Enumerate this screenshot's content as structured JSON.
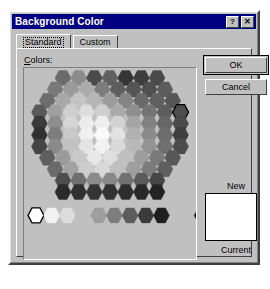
{
  "window": {
    "title": "Background Color",
    "help_button": "?",
    "close_button": "✕"
  },
  "tabs": [
    {
      "label": "Standard",
      "selected": true
    },
    {
      "label": "Custom",
      "selected": false
    }
  ],
  "colors_section": {
    "label_prefix": "C",
    "label_rest": "olors:"
  },
  "buttons": {
    "ok": "OK",
    "cancel": "Cancel"
  },
  "preview": {
    "new_label": "New",
    "current_label": "Current",
    "new_color": "#ffffff",
    "current_color": "#ffffff"
  },
  "palette": {
    "type": "grayscale-honeycomb",
    "selected_index": 33,
    "hex_width": 16,
    "hex_height": 15,
    "rows": [
      {
        "offset": 3,
        "colors": [
          "#6b6b6b",
          "#8c8c8c",
          "#4a4a4a",
          "#606060",
          "#353535",
          "#3d3d3d",
          "#4a4a4a"
        ]
      },
      {
        "offset": 2,
        "colors": [
          "#7a7a7a",
          "#9a9a9a",
          "#ababab",
          "#7d7d7d",
          "#5e5e5e",
          "#555555",
          "#4f4f4f",
          "#5c5c5c"
        ]
      },
      {
        "offset": 1,
        "colors": [
          "#6e6e6e",
          "#a8a8a8",
          "#c4c4c4",
          "#b5b5b5",
          "#9c9c9c",
          "#858585",
          "#6a6a6a",
          "#606060",
          "#565656"
        ]
      },
      {
        "offset": 0,
        "colors": [
          "#5a5a5a",
          "#9f9f9f",
          "#cfcfcf",
          "#dedede",
          "#cfcfcf",
          "#aaaaaa",
          "#8f8f8f",
          "#747474",
          "#5d5d5d",
          "#4d4d4d"
        ]
      },
      {
        "offset": 0,
        "colors": [
          "#3a3a3a",
          "#8e8e8e",
          "#d6d6d6",
          "#ececec",
          "#efefef",
          "#d2d2d2",
          "#a5a5a5",
          "#818181",
          "#666666",
          "#4a4a4a"
        ]
      },
      {
        "offset": 0,
        "colors": [
          "#2f2f2f",
          "#7d7d7d",
          "#c9c9c9",
          "#f0f0f0",
          "#fafafa",
          "#e2e2e2",
          "#b0b0b0",
          "#8a8a8a",
          "#6d6d6d",
          "#3f3f3f"
        ]
      },
      {
        "offset": 0,
        "colors": [
          "#454545",
          "#8a8a8a",
          "#c2c2c2",
          "#e4e4e4",
          "#f2f2f2",
          "#dadada",
          "#b8b8b8",
          "#949494",
          "#707070",
          "#4c4c4c"
        ]
      },
      {
        "offset": 1,
        "colors": [
          "#5e5e5e",
          "#9b9b9b",
          "#cacaca",
          "#e8e8e8",
          "#dfdfdf",
          "#c0c0c0",
          "#9d9d9d",
          "#7a7a7a",
          "#585858"
        ]
      },
      {
        "offset": 2,
        "colors": [
          "#6a6a6a",
          "#a2a2a2",
          "#cdcdcd",
          "#d8d8d8",
          "#bfbfbf",
          "#9e9e9e",
          "#7c7c7c",
          "#5f5f5f"
        ]
      },
      {
        "offset": 3,
        "colors": [
          "#4e4e4e",
          "#6f6f6f",
          "#8b8b8b",
          "#888888",
          "#727272",
          "#5a5a5a",
          "#464646"
        ]
      },
      {
        "offset": 3,
        "colors": [
          "#2a2a2a",
          "#303030",
          "#343434",
          "#323232",
          "#2d2d2d",
          "#282828",
          "#232323"
        ]
      }
    ],
    "ramp": {
      "selected_index": 0,
      "colors": [
        "#ffffff",
        "#f2f2f2",
        "#dcdcdc",
        "#bfbfbf",
        "#9e9e9e",
        "#7d7d7d",
        "#5c5c5c",
        "#3b3b3b",
        "#1f1f1f"
      ],
      "extra_color": "#111111"
    }
  }
}
